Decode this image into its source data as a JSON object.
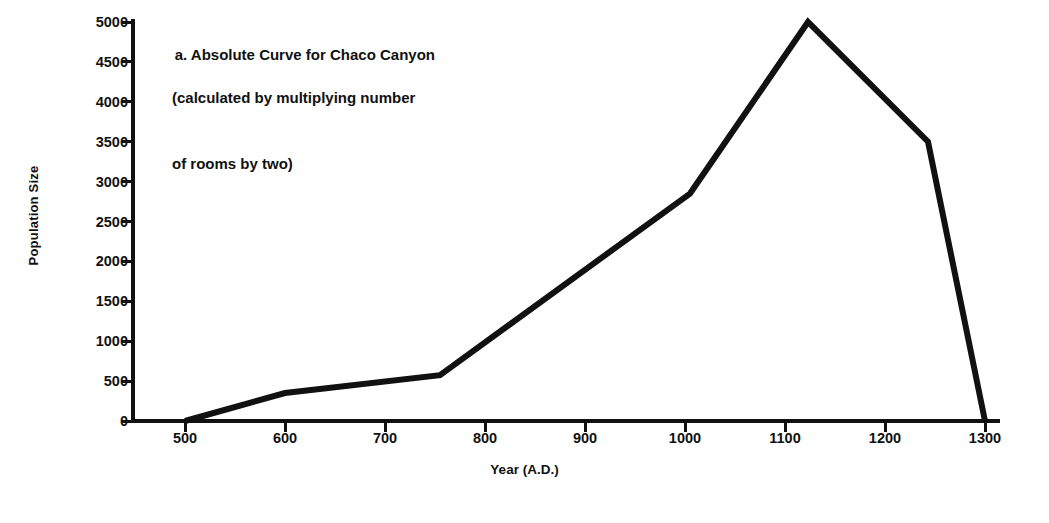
{
  "chart_data": {
    "type": "line",
    "title": "a. Absolute Curve for Chaco Canyon (calculated by multiplying number of rooms by two)",
    "title_lines": [
      "a. Absolute Curve for Chaco Canyon",
      "(calculated by multiplying number",
      "of rooms by two)"
    ],
    "xlabel": "Year (A.D.)",
    "ylabel": "Population Size",
    "xlim": [
      450,
      1320
    ],
    "ylim": [
      0,
      5000
    ],
    "xticks": [
      500,
      600,
      700,
      800,
      900,
      1000,
      1100,
      1200,
      1300
    ],
    "xtick_labels": [
      "500",
      "600",
      "700",
      "800",
      "900",
      "1000",
      "1100",
      "1200",
      "1300"
    ],
    "yticks": [
      0,
      500,
      1000,
      1500,
      2000,
      2500,
      3000,
      3500,
      4000,
      4500,
      5000
    ],
    "ytick_labels": [
      "0",
      "500",
      "1000",
      "1500",
      "2000",
      "2500",
      "3000",
      "3500",
      "4000",
      "4500",
      "5000"
    ],
    "grid": false,
    "legend": false,
    "series": [
      {
        "name": "Chaco Canyon population",
        "x": [
          500,
          600,
          755,
          1005,
          1123,
          1243,
          1300
        ],
        "values": [
          0,
          350,
          575,
          2850,
          5000,
          3500,
          0
        ]
      }
    ],
    "line_color": "#111111",
    "line_width": 6,
    "axis_color": "#111111",
    "background": "#ffffff"
  }
}
